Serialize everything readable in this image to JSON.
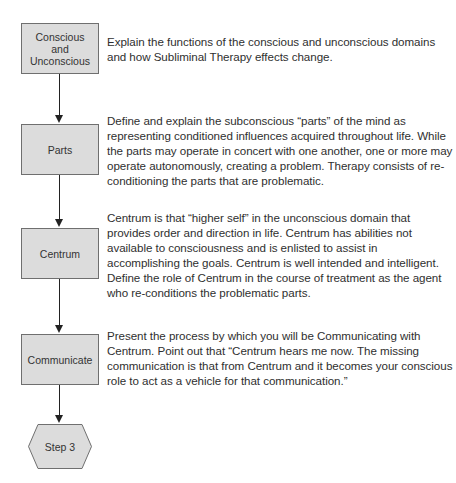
{
  "flowchart": {
    "steps": [
      {
        "label_lines": [
          "Conscious",
          "and",
          "Unconscious"
        ],
        "description": "Explain the functions of the conscious and unconscious domains and how Subliminal Therapy effects change."
      },
      {
        "label": "Parts",
        "description": "Define and explain the subconscious “parts” of the mind as representing conditioned influences acquired throughout life. While the parts may operate in concert with one another, one or more may operate autonomously, creating a problem. Therapy consists of re-conditioning the parts that are problematic."
      },
      {
        "label": "Centrum",
        "description": "Centrum is that “higher self” in the unconscious domain that provides order and direction in life. Centrum has abilities not available to consciousness and is enlisted to assist in accomplishing the goals. Centrum is well intended and intelligent. Define the role of Centrum in the course of treatment as the agent who re-conditions the problematic parts."
      },
      {
        "label": "Communicate",
        "description": "Present the process by which you will be Communicating with Centrum. Point out that “Centrum hears me now. The missing communication is that from Centrum and it becomes your conscious role to act as a vehicle for that communication.”"
      }
    ],
    "terminal": {
      "label": "Step 3",
      "shape": "hexagon"
    },
    "colors": {
      "box_fill": "#dcdcdc",
      "box_border": "#6f6f6f",
      "connector": "#222222",
      "text": "#2f2f2f"
    }
  }
}
